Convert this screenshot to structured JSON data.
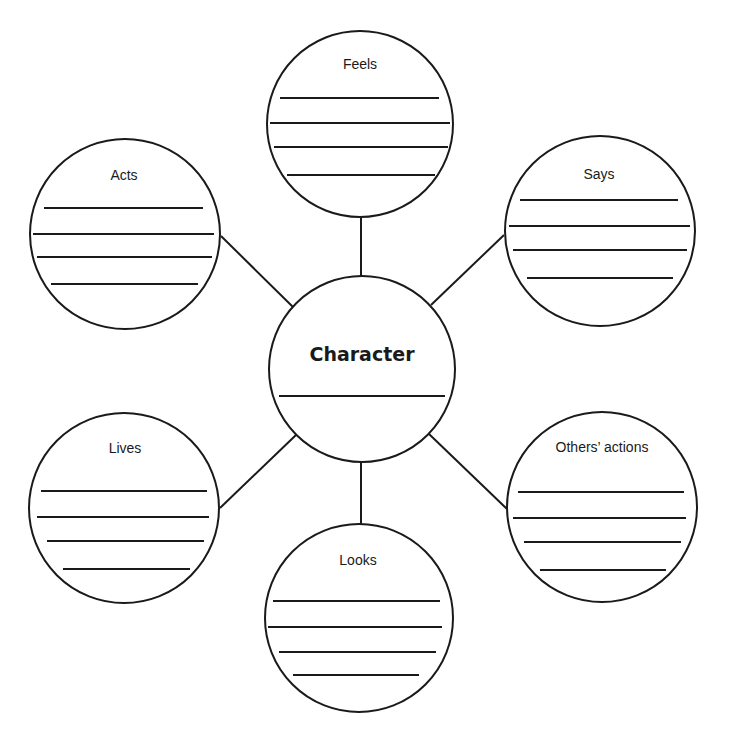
{
  "diagram": {
    "type": "character web / mind map",
    "center": {
      "label": "Character",
      "cx": 362,
      "cy": 369,
      "r": 93,
      "label_x": 362,
      "label_y": 361,
      "lines": [
        {
          "x1": 279,
          "x2": 445,
          "y": 396
        }
      ]
    },
    "nodes": [
      {
        "id": "feels",
        "label": "Feels",
        "cx": 360,
        "cy": 124,
        "r": 93,
        "label_x": 360,
        "label_y": 69,
        "lines": [
          {
            "x1": 280,
            "x2": 439,
            "y": 98
          },
          {
            "x1": 270,
            "x2": 450,
            "y": 123
          },
          {
            "x1": 274,
            "x2": 448,
            "y": 147
          },
          {
            "x1": 287,
            "x2": 435,
            "y": 175
          }
        ],
        "connector": {
          "x1": 361,
          "y1": 216,
          "x2": 361,
          "y2": 277
        }
      },
      {
        "id": "acts",
        "label": "Acts",
        "cx": 125,
        "cy": 234,
        "r": 95,
        "label_x": 124,
        "label_y": 180,
        "lines": [
          {
            "x1": 44,
            "x2": 203,
            "y": 208
          },
          {
            "x1": 33,
            "x2": 214,
            "y": 234
          },
          {
            "x1": 37,
            "x2": 212,
            "y": 257
          },
          {
            "x1": 51,
            "x2": 198,
            "y": 284
          }
        ],
        "connector": {
          "x1": 221,
          "y1": 236,
          "x2": 293,
          "y2": 307
        }
      },
      {
        "id": "says",
        "label": "Says",
        "cx": 600,
        "cy": 231,
        "r": 95,
        "label_x": 599,
        "label_y": 179,
        "lines": [
          {
            "x1": 520,
            "x2": 678,
            "y": 200
          },
          {
            "x1": 509,
            "x2": 690,
            "y": 226
          },
          {
            "x1": 513,
            "x2": 687,
            "y": 250
          },
          {
            "x1": 527,
            "x2": 673,
            "y": 278
          }
        ],
        "connector": {
          "x1": 431,
          "y1": 305,
          "x2": 504,
          "y2": 235
        }
      },
      {
        "id": "lives",
        "label": "Lives",
        "cx": 124,
        "cy": 508,
        "r": 95,
        "label_x": 125,
        "label_y": 453,
        "lines": [
          {
            "x1": 41,
            "x2": 207,
            "y": 491
          },
          {
            "x1": 37,
            "x2": 209,
            "y": 517
          },
          {
            "x1": 47,
            "x2": 204,
            "y": 541
          },
          {
            "x1": 63,
            "x2": 190,
            "y": 569
          }
        ],
        "connector": {
          "x1": 296,
          "y1": 435,
          "x2": 220,
          "y2": 508
        }
      },
      {
        "id": "others-actions",
        "label": "Others’ actions",
        "cx": 602,
        "cy": 507,
        "r": 95,
        "label_x": 602,
        "label_y": 452,
        "lines": [
          {
            "x1": 518,
            "x2": 684,
            "y": 492
          },
          {
            "x1": 513,
            "x2": 686,
            "y": 518
          },
          {
            "x1": 524,
            "x2": 681,
            "y": 542
          },
          {
            "x1": 540,
            "x2": 666,
            "y": 570
          }
        ],
        "connector": {
          "x1": 429,
          "y1": 434,
          "x2": 507,
          "y2": 509
        }
      },
      {
        "id": "looks",
        "label": "Looks",
        "cx": 359,
        "cy": 618,
        "r": 94,
        "label_x": 358,
        "label_y": 565,
        "lines": [
          {
            "x1": 273,
            "x2": 440,
            "y": 601
          },
          {
            "x1": 268,
            "x2": 442,
            "y": 627
          },
          {
            "x1": 279,
            "x2": 436,
            "y": 652
          },
          {
            "x1": 293,
            "x2": 419,
            "y": 675
          }
        ],
        "connector": {
          "x1": 361,
          "y1": 461,
          "x2": 361,
          "y2": 524
        }
      }
    ],
    "colors": {
      "stroke": "#1a1a1a",
      "fill": "#ffffff",
      "background": "#ffffff"
    }
  }
}
